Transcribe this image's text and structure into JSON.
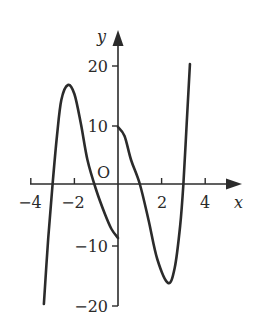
{
  "chart_data": {
    "type": "line",
    "title": "",
    "xlabel": "x",
    "ylabel": "y",
    "origin_label": "O",
    "xlim": [
      -4,
      5
    ],
    "ylim": [
      -20,
      22
    ],
    "grid": false,
    "x_ticks": [
      -4,
      -2,
      2,
      4
    ],
    "x_tick_labels": [
      "−4",
      "−2",
      "2",
      "4"
    ],
    "y_ticks": [
      20,
      10,
      -10,
      -20
    ],
    "y_tick_labels": [
      "20",
      "10",
      "−10",
      "−20"
    ],
    "series": [
      {
        "name": "left branch (x<0)",
        "x": [
          -3.4,
          -3.2,
          -3.0,
          -2.8,
          -2.6,
          -2.3,
          -2.0,
          -1.7,
          -1.4,
          -1.0,
          -0.6,
          -0.3,
          0.0
        ],
        "y": [
          -20,
          -9,
          0,
          8,
          14,
          16.5,
          15,
          10,
          4,
          -1,
          -5,
          -7.5,
          -9
        ]
      },
      {
        "name": "right branch (x>0)",
        "x": [
          0.0,
          0.3,
          0.6,
          1.0,
          1.4,
          1.8,
          2.3,
          2.6,
          2.85,
          3.0,
          3.15,
          3.3
        ],
        "y": [
          9.5,
          8,
          4,
          0,
          -6,
          -12.5,
          -16.5,
          -14,
          -7,
          0,
          10,
          20
        ]
      }
    ],
    "colors": {
      "curve": "#2b2b2b",
      "axes": "#2b2b2b",
      "text": "#2a2a2a"
    }
  }
}
